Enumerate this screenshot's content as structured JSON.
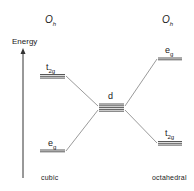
{
  "diagram": {
    "titles": {
      "left": {
        "main": "O",
        "sub": "h"
      },
      "right": {
        "main": "O",
        "sub": "h"
      }
    },
    "axis": {
      "label": "Energy"
    },
    "levels": {
      "cubic_t2g": {
        "main": "t",
        "sub": "2g"
      },
      "cubic_eg": {
        "main": "e",
        "sub": "g"
      },
      "free_d": {
        "main": "d"
      },
      "oct_eg": {
        "main": "e",
        "sub": "g"
      },
      "oct_t2g": {
        "main": "t",
        "sub": "2g"
      }
    },
    "captions": {
      "left": "cubic",
      "right": "octahedral"
    },
    "colors": {
      "line": "#333333",
      "background": "#ffffff"
    }
  }
}
